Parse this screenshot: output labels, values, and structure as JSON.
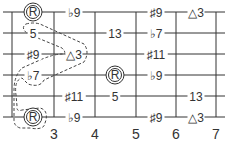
{
  "diagram": {
    "type": "guitar-fretboard",
    "colors": {
      "line": "#333333",
      "text": "#333333",
      "background": "#ffffff"
    },
    "fret_numbers": [
      "3",
      "4",
      "5",
      "6",
      "7"
    ],
    "strings": [
      {
        "notes": [
          {
            "pos": 0,
            "label": "R",
            "root": true
          },
          {
            "pos": 1,
            "label": "♭9"
          },
          {
            "pos": 3,
            "label": "♯9"
          },
          {
            "pos": 4,
            "label": "△3"
          }
        ]
      },
      {
        "notes": [
          {
            "pos": 0,
            "label": "5"
          },
          {
            "pos": 2,
            "label": "13"
          },
          {
            "pos": 3,
            "label": "♭7"
          }
        ]
      },
      {
        "notes": [
          {
            "pos": 0,
            "label": "♯9"
          },
          {
            "pos": 1,
            "label": "△3"
          },
          {
            "pos": 3,
            "label": "♯11"
          }
        ]
      },
      {
        "notes": [
          {
            "pos": 0,
            "label": "♭7"
          },
          {
            "pos": 2,
            "label": "R",
            "root": true
          },
          {
            "pos": 3,
            "label": "♭9"
          }
        ]
      },
      {
        "notes": [
          {
            "pos": 1,
            "label": "♯11"
          },
          {
            "pos": 2,
            "label": "5"
          },
          {
            "pos": 4,
            "label": "13"
          }
        ]
      },
      {
        "notes": [
          {
            "pos": 0,
            "label": "R",
            "root": true
          },
          {
            "pos": 1,
            "label": "♭9"
          },
          {
            "pos": 3,
            "label": "♯9"
          },
          {
            "pos": 4,
            "label": "△3"
          }
        ]
      }
    ]
  }
}
